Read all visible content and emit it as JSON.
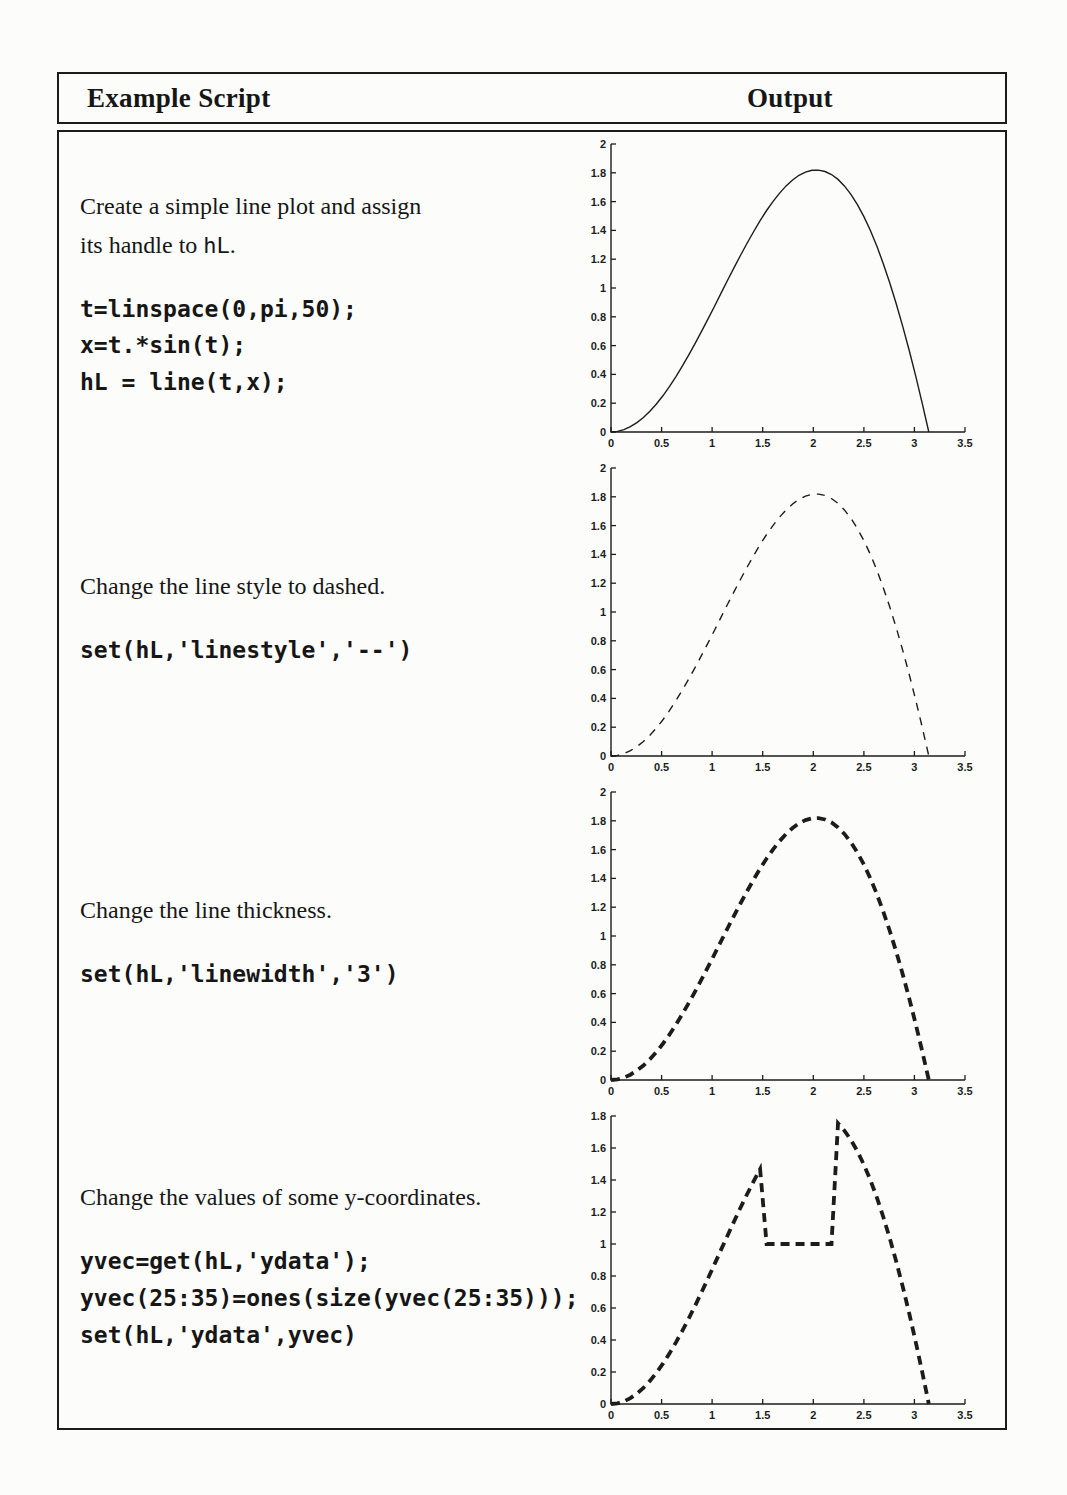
{
  "header": {
    "script_col": "Example Script",
    "output_col": "Output"
  },
  "ink_color": "#1c1c1c",
  "rows": [
    {
      "description": {
        "line1": "Create a simple line plot and assign",
        "line2_pre": "its handle to ",
        "line2_code": "hL",
        "line2_post": "."
      },
      "code": [
        "t=linspace(0,pi,50);",
        "x=t.*sin(t);",
        "hL = line(t,x);"
      ]
    },
    {
      "description": {
        "line1": "Change the line style to dashed.",
        "line2_pre": "",
        "line2_code": "",
        "line2_post": ""
      },
      "code": [
        "set(hL,'linestyle','--')"
      ]
    },
    {
      "description": {
        "line1": "Change the line thickness.",
        "line2_pre": "",
        "line2_code": "",
        "line2_post": ""
      },
      "code": [
        "set(hL,'linewidth','3')"
      ]
    },
    {
      "description": {
        "line1": "Change the values of some y-coordinates.",
        "line2_pre": "",
        "line2_code": "",
        "line2_post": ""
      },
      "code": [
        "yvec=get(hL,'ydata');",
        "yvec(25:35)=ones(size(yvec(25:35)));",
        "set(hL,'ydata',yvec)"
      ]
    }
  ],
  "chart_data": [
    {
      "type": "line",
      "title": "",
      "xlabel": "",
      "ylabel": "",
      "grid": false,
      "legend": null,
      "axes": "left-bottom",
      "linestyle": "solid",
      "linewidth": 1,
      "xlim": [
        0,
        3.5
      ],
      "ylim": [
        0,
        2
      ],
      "xticks": [
        0,
        0.5,
        1,
        1.5,
        2,
        2.5,
        3,
        3.5
      ],
      "xtick_labels": [
        "0",
        "0.5",
        "1",
        "1.5",
        "2",
        "2.5",
        "3",
        "3.5"
      ],
      "yticks": [
        0,
        0.2,
        0.4,
        0.6,
        0.8,
        1,
        1.2,
        1.4,
        1.6,
        1.8,
        2
      ],
      "ytick_labels": [
        "0",
        "0.2",
        "0.4",
        "0.6",
        "0.8",
        "1",
        "1.2",
        "1.4",
        "1.6",
        "1.8",
        "2"
      ],
      "x": [
        0,
        0.0641,
        0.1282,
        0.1923,
        0.2565,
        0.3206,
        0.3847,
        0.4488,
        0.5129,
        0.577,
        0.6411,
        0.7053,
        0.7694,
        0.8335,
        0.8976,
        0.9617,
        1.0258,
        1.0899,
        1.1541,
        1.2182,
        1.2823,
        1.3464,
        1.4105,
        1.4746,
        1.5387,
        1.6028,
        1.6669,
        1.731,
        1.7951,
        1.8592,
        1.9233,
        1.9875,
        2.0516,
        2.1157,
        2.1798,
        2.2439,
        2.308,
        2.3721,
        2.4362,
        2.5004,
        2.5645,
        2.6286,
        2.6927,
        2.7568,
        2.8209,
        2.885,
        2.9491,
        3.0132,
        3.0774,
        3.1416
      ],
      "y": [
        0,
        0.0041,
        0.0164,
        0.0368,
        0.0651,
        0.101,
        0.1444,
        0.1947,
        0.2517,
        0.3148,
        0.3835,
        0.4572,
        0.5353,
        0.617,
        0.7018,
        0.7888,
        0.8772,
        0.9663,
        1.0553,
        1.1432,
        1.2293,
        1.3126,
        1.3924,
        1.4679,
        1.5379,
        1.602,
        1.6592,
        1.7088,
        1.7501,
        1.7824,
        1.805,
        1.8174,
        1.819,
        1.8093,
        1.7879,
        1.7545,
        1.7087,
        1.6504,
        1.5794,
        1.4957,
        1.3992,
        1.2901,
        1.1686,
        1.0348,
        0.8892,
        0.7321,
        0.5643,
        0.3858,
        0.1974,
        0
      ]
    },
    {
      "type": "line",
      "title": "",
      "xlabel": "",
      "ylabel": "",
      "grid": false,
      "legend": null,
      "axes": "left-bottom",
      "linestyle": "dashed",
      "linewidth": 1,
      "xlim": [
        0,
        3.5
      ],
      "ylim": [
        0,
        2
      ],
      "xticks": [
        0,
        0.5,
        1,
        1.5,
        2,
        2.5,
        3,
        3.5
      ],
      "xtick_labels": [
        "0",
        "0.5",
        "1",
        "1.5",
        "2",
        "2.5",
        "3",
        "3.5"
      ],
      "yticks": [
        0,
        0.2,
        0.4,
        0.6,
        0.8,
        1,
        1.2,
        1.4,
        1.6,
        1.8,
        2
      ],
      "ytick_labels": [
        "0",
        "0.2",
        "0.4",
        "0.6",
        "0.8",
        "1",
        "1.2",
        "1.4",
        "1.6",
        "1.8",
        "2"
      ],
      "x": [
        0,
        0.0641,
        0.1282,
        0.1923,
        0.2565,
        0.3206,
        0.3847,
        0.4488,
        0.5129,
        0.577,
        0.6411,
        0.7053,
        0.7694,
        0.8335,
        0.8976,
        0.9617,
        1.0258,
        1.0899,
        1.1541,
        1.2182,
        1.2823,
        1.3464,
        1.4105,
        1.4746,
        1.5387,
        1.6028,
        1.6669,
        1.731,
        1.7951,
        1.8592,
        1.9233,
        1.9875,
        2.0516,
        2.1157,
        2.1798,
        2.2439,
        2.308,
        2.3721,
        2.4362,
        2.5004,
        2.5645,
        2.6286,
        2.6927,
        2.7568,
        2.8209,
        2.885,
        2.9491,
        3.0132,
        3.0774,
        3.1416
      ],
      "y": [
        0,
        0.0041,
        0.0164,
        0.0368,
        0.0651,
        0.101,
        0.1444,
        0.1947,
        0.2517,
        0.3148,
        0.3835,
        0.4572,
        0.5353,
        0.617,
        0.7018,
        0.7888,
        0.8772,
        0.9663,
        1.0553,
        1.1432,
        1.2293,
        1.3126,
        1.3924,
        1.4679,
        1.5379,
        1.602,
        1.6592,
        1.7088,
        1.7501,
        1.7824,
        1.805,
        1.8174,
        1.819,
        1.8093,
        1.7879,
        1.7545,
        1.7087,
        1.6504,
        1.5794,
        1.4957,
        1.3992,
        1.2901,
        1.1686,
        1.0348,
        0.8892,
        0.7321,
        0.5643,
        0.3858,
        0.1974,
        0
      ]
    },
    {
      "type": "line",
      "title": "",
      "xlabel": "",
      "ylabel": "",
      "grid": false,
      "legend": null,
      "axes": "left-bottom",
      "linestyle": "dashed",
      "linewidth": 3,
      "xlim": [
        0,
        3.5
      ],
      "ylim": [
        0,
        2
      ],
      "xticks": [
        0,
        0.5,
        1,
        1.5,
        2,
        2.5,
        3,
        3.5
      ],
      "xtick_labels": [
        "0",
        "0.5",
        "1",
        "1.5",
        "2",
        "2.5",
        "3",
        "3.5"
      ],
      "yticks": [
        0,
        0.2,
        0.4,
        0.6,
        0.8,
        1,
        1.2,
        1.4,
        1.6,
        1.8,
        2
      ],
      "ytick_labels": [
        "0",
        "0.2",
        "0.4",
        "0.6",
        "0.8",
        "1",
        "1.2",
        "1.4",
        "1.6",
        "1.8",
        "2"
      ],
      "x": [
        0,
        0.0641,
        0.1282,
        0.1923,
        0.2565,
        0.3206,
        0.3847,
        0.4488,
        0.5129,
        0.577,
        0.6411,
        0.7053,
        0.7694,
        0.8335,
        0.8976,
        0.9617,
        1.0258,
        1.0899,
        1.1541,
        1.2182,
        1.2823,
        1.3464,
        1.4105,
        1.4746,
        1.5387,
        1.6028,
        1.6669,
        1.731,
        1.7951,
        1.8592,
        1.9233,
        1.9875,
        2.0516,
        2.1157,
        2.1798,
        2.2439,
        2.308,
        2.3721,
        2.4362,
        2.5004,
        2.5645,
        2.6286,
        2.6927,
        2.7568,
        2.8209,
        2.885,
        2.9491,
        3.0132,
        3.0774,
        3.1416
      ],
      "y": [
        0,
        0.0041,
        0.0164,
        0.0368,
        0.0651,
        0.101,
        0.1444,
        0.1947,
        0.2517,
        0.3148,
        0.3835,
        0.4572,
        0.5353,
        0.617,
        0.7018,
        0.7888,
        0.8772,
        0.9663,
        1.0553,
        1.1432,
        1.2293,
        1.3126,
        1.3924,
        1.4679,
        1.5379,
        1.602,
        1.6592,
        1.7088,
        1.7501,
        1.7824,
        1.805,
        1.8174,
        1.819,
        1.8093,
        1.7879,
        1.7545,
        1.7087,
        1.6504,
        1.5794,
        1.4957,
        1.3992,
        1.2901,
        1.1686,
        1.0348,
        0.8892,
        0.7321,
        0.5643,
        0.3858,
        0.1974,
        0
      ]
    },
    {
      "type": "line",
      "title": "",
      "xlabel": "",
      "ylabel": "",
      "grid": false,
      "legend": null,
      "axes": "left-bottom",
      "linestyle": "dashed",
      "linewidth": 3,
      "xlim": [
        0,
        3.5
      ],
      "ylim": [
        0,
        1.8
      ],
      "xticks": [
        0,
        0.5,
        1,
        1.5,
        2,
        2.5,
        3,
        3.5
      ],
      "xtick_labels": [
        "0",
        "0.5",
        "1",
        "1.5",
        "2",
        "2.5",
        "3",
        "3.5"
      ],
      "yticks": [
        0,
        0.2,
        0.4,
        0.6,
        0.8,
        1,
        1.2,
        1.4,
        1.6,
        1.8
      ],
      "ytick_labels": [
        "0",
        "0.2",
        "0.4",
        "0.6",
        "0.8",
        "1",
        "1.2",
        "1.4",
        "1.6",
        "1.8"
      ],
      "x": [
        0,
        0.0641,
        0.1282,
        0.1923,
        0.2565,
        0.3206,
        0.3847,
        0.4488,
        0.5129,
        0.577,
        0.6411,
        0.7053,
        0.7694,
        0.8335,
        0.8976,
        0.9617,
        1.0258,
        1.0899,
        1.1541,
        1.2182,
        1.2823,
        1.3464,
        1.4105,
        1.4746,
        1.5387,
        1.6028,
        1.6669,
        1.731,
        1.7951,
        1.8592,
        1.9233,
        1.9875,
        2.0516,
        2.1157,
        2.1798,
        2.2439,
        2.308,
        2.3721,
        2.4362,
        2.5004,
        2.5645,
        2.6286,
        2.6927,
        2.7568,
        2.8209,
        2.885,
        2.9491,
        3.0132,
        3.0774,
        3.1416
      ],
      "y": [
        0,
        0.0041,
        0.0164,
        0.0368,
        0.0651,
        0.101,
        0.1444,
        0.1947,
        0.2517,
        0.3148,
        0.3835,
        0.4572,
        0.5353,
        0.617,
        0.7018,
        0.7888,
        0.8772,
        0.9663,
        1.0553,
        1.1432,
        1.2293,
        1.3126,
        1.3924,
        1.4679,
        1,
        1,
        1,
        1,
        1,
        1,
        1,
        1,
        1,
        1,
        1,
        1.7545,
        1.7087,
        1.6504,
        1.5794,
        1.4957,
        1.3992,
        1.2901,
        1.1686,
        1.0348,
        0.8892,
        0.7321,
        0.5643,
        0.3858,
        0.1974,
        0
      ]
    }
  ]
}
